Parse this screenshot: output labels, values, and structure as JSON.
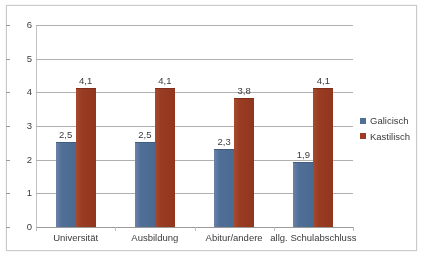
{
  "chart_data": {
    "type": "bar",
    "title": "",
    "subtitle": "",
    "xlabel": "",
    "ylabel": "",
    "ylim": [
      0,
      6
    ],
    "yticks": [
      "0",
      "1",
      "2",
      "3",
      "4",
      "5",
      "6"
    ],
    "grid": true,
    "legend_position": "right",
    "decimal_separator": ",",
    "categories": [
      "Universität",
      "Ausbildung",
      "Abitur/andere",
      "allg. Schulabschluss"
    ],
    "series": [
      {
        "name": "Galicisch",
        "color": "#4f6f98",
        "values": [
          2.5,
          2.5,
          2.3,
          1.9
        ],
        "labels": [
          "2,5",
          "2,5",
          "2,3",
          "1,9"
        ]
      },
      {
        "name": "Kastilisch",
        "color": "#9c3b22",
        "values": [
          4.1,
          4.1,
          3.8,
          4.1
        ],
        "labels": [
          "4,1",
          "4,1",
          "3,8",
          "4,1"
        ]
      }
    ]
  },
  "legend": {
    "entries": [
      {
        "label": "Galicisch",
        "color": "#4f6f98"
      },
      {
        "label": "Kastilisch",
        "color": "#9c3b22"
      }
    ]
  },
  "colors": {
    "series_galicisch": "#4f6f98",
    "series_kastilisch": "#9c3b22",
    "gridline": "#b0b0b0",
    "frame": "#c9c9c9",
    "text": "#3b3b3b",
    "background": "#ffffff"
  }
}
